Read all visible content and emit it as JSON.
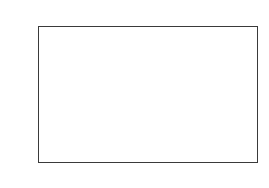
{
  "chart_data": {
    "type": "line",
    "panel_label": "b",
    "xlabel": "ω",
    "ylabel": "LOG P (ω)",
    "xlim": [
      0,
      30
    ],
    "ylim": [
      -15,
      5
    ],
    "xticks": [
      0,
      5,
      10,
      15,
      20,
      25,
      30
    ],
    "xtick_labels": [
      "0",
      "5",
      "10",
      "15",
      "20",
      "25",
      "30"
    ],
    "yticks": [
      5,
      0,
      -5,
      -10,
      -15
    ],
    "ytick_labels": [
      "5",
      "0",
      "-5",
      "-10",
      "-15"
    ],
    "x_minor_tick_interval": 1,
    "y_minor_tick_interval": 1,
    "grid": false,
    "legend": "none",
    "line_color": "#000000",
    "frame_color": "#3a3a3a",
    "background": "#ffffff",
    "series": [
      {
        "name": "LOG P (ω)",
        "envelope_x": [
          0,
          0.3,
          1,
          2,
          3,
          4,
          5,
          6,
          7,
          8,
          9,
          10,
          10.8,
          11.5,
          12.5,
          13.5,
          14.5,
          15.5,
          16.2,
          16.6,
          17.2,
          18,
          19,
          20,
          21,
          22,
          23,
          24,
          25,
          25.6,
          26.5,
          27.5,
          28.5,
          29.3,
          30
        ],
        "envelope_y": [
          1.6,
          2.3,
          1.1,
          -0.6,
          -2.2,
          -3.7,
          -5.1,
          -6.5,
          -7.8,
          -9.0,
          -10.0,
          -10.9,
          -11.4,
          -11.8,
          -12.0,
          -12.1,
          -12.0,
          -11.9,
          -11.5,
          -10.6,
          -11.4,
          -12.0,
          -12.1,
          -12.0,
          -12.1,
          -12.2,
          -12.1,
          -11.9,
          -11.6,
          -11.2,
          -11.7,
          -12.0,
          -12.1,
          -12.0,
          -12.1
        ],
        "noise_amplitude_low": 1.6,
        "noise_amplitude_high": 0.35
      }
    ]
  }
}
